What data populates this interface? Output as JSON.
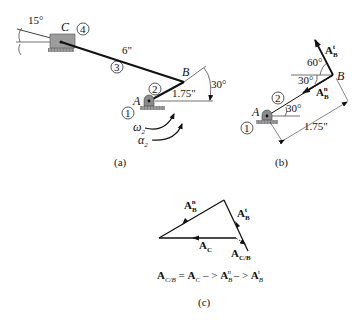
{
  "figure_a": {
    "caption": "(a)",
    "angle_c": "15°",
    "point_c": "C",
    "link_4": "4",
    "link_3": "3",
    "length_cb": "6\"",
    "point_b": "B",
    "angle_b": "30°",
    "point_a": "A",
    "link_2": "2",
    "length_ab": "1.75\"",
    "link_1": "1",
    "omega": "ω",
    "omega_sub": "2",
    "alpha": "α",
    "alpha_sub": "2"
  },
  "figure_b": {
    "caption": "(b)",
    "vec_t": "A",
    "vec_t_sub": "B",
    "vec_t_sup": "t",
    "angle_60": "60°",
    "angle_30_top": "30°",
    "point_b": "B",
    "vec_n": "A",
    "vec_n_sub": "B",
    "vec_n_sup": "n",
    "link_2": "2",
    "point_a": "A",
    "angle_30_bottom": "30°",
    "link_1": "1",
    "length": "1.75\""
  },
  "figure_c": {
    "caption": "(c)",
    "vec_n": "A",
    "vec_n_sub": "B",
    "vec_n_sup": "n",
    "vec_t": "A",
    "vec_t_sub": "B",
    "vec_t_sup": "t",
    "vec_c": "A",
    "vec_c_sub": "C",
    "vec_cb": "A",
    "vec_cb_sub": "C/B",
    "equation": {
      "lhs": "A",
      "lhs_sub": "C/B",
      "eq": " = ",
      "t1": "A",
      "t1_sub": "C",
      "arrow1": " – > ",
      "t2": "A",
      "t2_sub": "B",
      "t2_sup": "n",
      "arrow2": " – > ",
      "t3": "A",
      "t3_sub": "B",
      "t3_sup": "t"
    }
  }
}
